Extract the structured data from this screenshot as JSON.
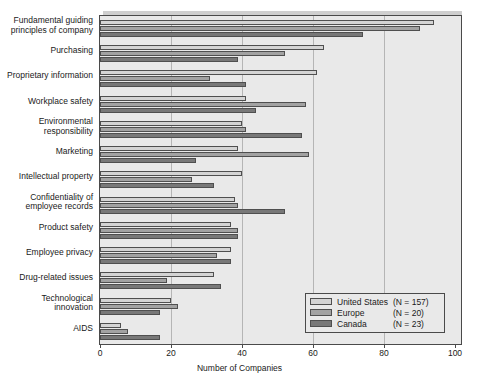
{
  "figure": {
    "top_caption": "",
    "background": "#ffffff",
    "plot_background": "#e9e9e9"
  },
  "chart_data": {
    "type": "bar",
    "orientation": "horizontal",
    "title": "",
    "xlabel": "Number of Companies",
    "ylabel": "",
    "xlim": [
      0,
      100
    ],
    "xticks": [
      0,
      20,
      40,
      60,
      80,
      100
    ],
    "grid": false,
    "legend_position": "bottom-right",
    "categories": [
      "Fundamental guiding principles of company",
      "Purchasing",
      "Proprietary information",
      "Workplace safety",
      "Environmental responsibility",
      "Marketing",
      "Intellectual property",
      "Confidentiality of employee records",
      "Product safety",
      "Employee privacy",
      "Drug-related issues",
      "Technological innovation",
      "AIDS"
    ],
    "category_lines": [
      [
        "Fundamental guiding",
        "principles of company"
      ],
      [
        "Purchasing"
      ],
      [
        "Proprietary information"
      ],
      [
        "Workplace safety"
      ],
      [
        "Environmental",
        "responsibility"
      ],
      [
        "Marketing"
      ],
      [
        "Intellectual property"
      ],
      [
        "Confidentiality of",
        "employee records"
      ],
      [
        "Product safety"
      ],
      [
        "Employee privacy"
      ],
      [
        "Drug-related issues"
      ],
      [
        "Technological",
        "innovation"
      ],
      [
        "AIDS"
      ]
    ],
    "series": [
      {
        "name": "United States",
        "n_label": "(N = 157)",
        "color": "#d4d4d4",
        "values": [
          94,
          63,
          61,
          41,
          40,
          39,
          40,
          38,
          37,
          37,
          32,
          20,
          6
        ]
      },
      {
        "name": "Europe",
        "n_label": "(N = 20)",
        "color": "#a2a2a2",
        "values": [
          90,
          52,
          31,
          58,
          41,
          59,
          26,
          39,
          39,
          33,
          19,
          22,
          8
        ]
      },
      {
        "name": "Canada",
        "n_label": "(N = 23)",
        "color": "#787878",
        "values": [
          74,
          39,
          41,
          44,
          57,
          27,
          32,
          52,
          39,
          37,
          34,
          17,
          17
        ]
      }
    ]
  },
  "legend": {
    "entries": [
      {
        "label": "United States",
        "n": "(N = 157)",
        "key": "us"
      },
      {
        "label": "Europe",
        "n": "(N = 20)",
        "key": "eu"
      },
      {
        "label": "Canada",
        "n": "(N = 23)",
        "key": "ca"
      }
    ]
  },
  "axis": {
    "x_title": "Number of Companies",
    "x_tick_labels": [
      "0",
      "20",
      "40",
      "60",
      "80",
      "100"
    ]
  }
}
